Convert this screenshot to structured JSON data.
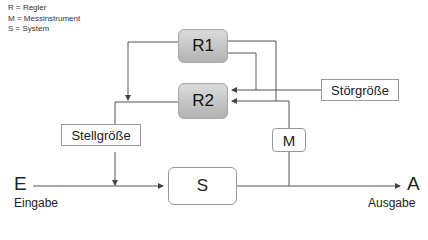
{
  "legend": [
    "R = Regler",
    "M = Messinstrument",
    "S = System"
  ],
  "blocks": {
    "r1": "R1",
    "r2": "R2",
    "s": "S",
    "m": "M",
    "stellgroesse": "Stellgröße",
    "stoergroesse": "Störgröße"
  },
  "io": {
    "input_symbol": "E",
    "input_label": "Eingabe",
    "output_symbol": "A",
    "output_label": "Ausgabe"
  },
  "colors": {
    "line": "#555555",
    "regler_fill": "#c4c4c4",
    "box_border": "#999999"
  }
}
